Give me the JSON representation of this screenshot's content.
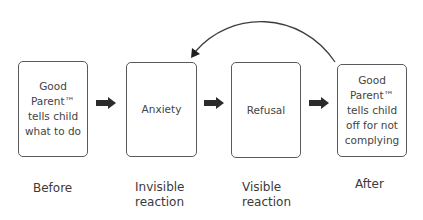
{
  "diagram": {
    "type": "flow",
    "boxes": [
      {
        "id": "before",
        "text": "Good\nParent™\ntells child\nwhat to do"
      },
      {
        "id": "invisible",
        "text": "Anxiety"
      },
      {
        "id": "visible",
        "text": "Refusal"
      },
      {
        "id": "after",
        "text": "Good\nParent™\ntells child\noff for not\ncomplying"
      }
    ],
    "labels": [
      "Before",
      "Invisible\nreaction",
      "Visible\nreaction",
      "After"
    ],
    "arrows": [
      {
        "from": "before",
        "to": "invisible"
      },
      {
        "from": "invisible",
        "to": "visible"
      },
      {
        "from": "visible",
        "to": "after"
      },
      {
        "from": "after",
        "to": "invisible",
        "style": "curved-feedback"
      }
    ],
    "colors": {
      "stroke": "#5a5a5a",
      "arrow_fill": "#2b2b2b",
      "text": "#3a3a3a"
    }
  }
}
